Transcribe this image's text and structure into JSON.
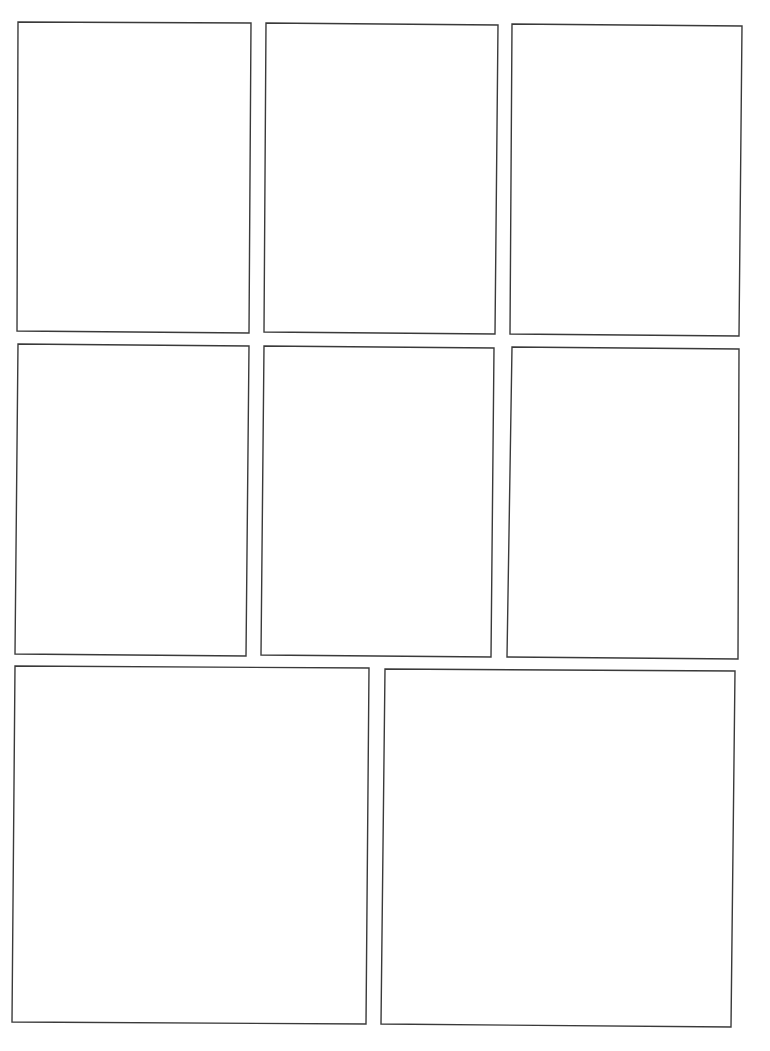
{
  "page": {
    "type": "comic-panel-template",
    "background": "#ffffff",
    "stroke_color": "#3a3a3a",
    "rows": 3
  },
  "panels": [
    {
      "id": 1,
      "points": "18,22 251,23 249,333 17,331"
    },
    {
      "id": 2,
      "points": "266,23 498,25 495,334 264,332"
    },
    {
      "id": 3,
      "points": "512,24 742,26 739,336 510,334"
    },
    {
      "id": 4,
      "points": "18,344 249,346 246,656 15,654"
    },
    {
      "id": 5,
      "points": "264,346 494,348 491,657 261,655"
    },
    {
      "id": 6,
      "points": "512,347 739,349 738,659 507,657"
    },
    {
      "id": 7,
      "points": "15,666 369,668 366,1024 12,1022"
    },
    {
      "id": 8,
      "points": "385,669 735,671 731,1027 381,1024"
    }
  ]
}
